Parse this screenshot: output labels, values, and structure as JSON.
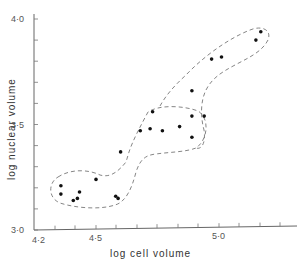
{
  "chart_data": {
    "type": "scatter",
    "title": "",
    "xlabel": "log cell volume",
    "ylabel": "log nuclear volume",
    "xlim": [
      4.2,
      5.3
    ],
    "ylim": [
      3.0,
      4.0
    ],
    "x_ticks": [
      {
        "value": 4.2,
        "label": "4·2"
      },
      {
        "value": 4.5,
        "label": "4·5"
      },
      {
        "value": 5.0,
        "label": "5·0"
      }
    ],
    "y_ticks": [
      {
        "value": 3.0,
        "label": "3·0"
      },
      {
        "value": 3.5,
        "label": "3·5"
      },
      {
        "value": 4.0,
        "label": "4·0"
      }
    ],
    "grid": false,
    "legend": null,
    "series": [
      {
        "name": "cluster 1",
        "points": [
          [
            4.33,
            3.21
          ],
          [
            4.33,
            3.17
          ],
          [
            4.39,
            3.14
          ],
          [
            4.41,
            3.15
          ],
          [
            4.42,
            3.18
          ],
          [
            4.5,
            3.24
          ],
          [
            4.58,
            3.16
          ],
          [
            4.59,
            3.15
          ]
        ]
      },
      {
        "name": "transition",
        "points": [
          [
            4.6,
            3.37
          ]
        ]
      },
      {
        "name": "cluster 2",
        "points": [
          [
            4.68,
            3.47
          ],
          [
            4.73,
            3.56
          ],
          [
            4.72,
            3.48
          ],
          [
            4.77,
            3.47
          ],
          [
            4.84,
            3.49
          ],
          [
            4.89,
            3.54
          ],
          [
            4.89,
            3.44
          ],
          [
            4.94,
            3.54
          ]
        ]
      },
      {
        "name": "cluster 3",
        "points": [
          [
            4.89,
            3.66
          ],
          [
            4.97,
            3.81
          ],
          [
            5.01,
            3.82
          ],
          [
            5.15,
            3.9
          ],
          [
            5.17,
            3.94
          ]
        ]
      }
    ],
    "annotations": "Dashed outlines enclose three clusters connected by an S-shaped dashed band"
  }
}
